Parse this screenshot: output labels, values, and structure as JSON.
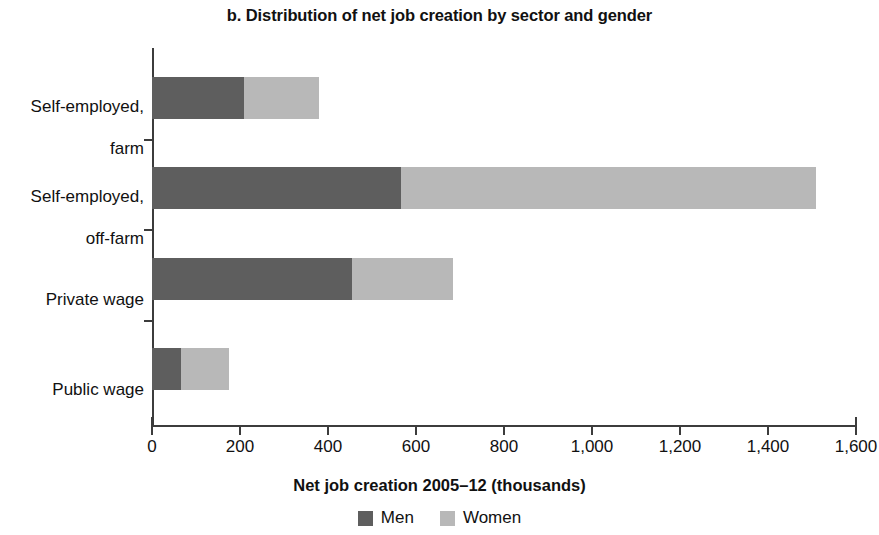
{
  "title": "b. Distribution of net job creation by sector and gender",
  "axis_title": "Net job creation 2005–12 (thousands)",
  "legend": {
    "items": [
      {
        "label": "Men",
        "color": "#5e5e5e"
      },
      {
        "label": "Women",
        "color": "#b8b8b8"
      }
    ]
  },
  "xticklabels": [
    "0",
    "200",
    "400",
    "600",
    "800",
    "1,000",
    "1,200",
    "1,400",
    "1,600"
  ],
  "categories": [
    {
      "line1": "Self-employed,",
      "line2": "farm"
    },
    {
      "line1": "Self-employed,",
      "line2": "off-farm"
    },
    {
      "line1": "Private wage",
      "line2": ""
    },
    {
      "line1": "Public wage",
      "line2": ""
    }
  ],
  "chart_data": {
    "type": "bar",
    "orientation": "horizontal",
    "stacked": true,
    "title": "b. Distribution of net job creation by sector and gender",
    "xlabel": "Net job creation 2005–12 (thousands)",
    "ylabel": "",
    "xlim": [
      0,
      1600
    ],
    "xticks": [
      0,
      200,
      400,
      600,
      800,
      1000,
      1200,
      1400,
      1600
    ],
    "xticklabels": [
      "0",
      "200",
      "400",
      "600",
      "800",
      "1,000",
      "1,200",
      "1,400",
      "1,600"
    ],
    "grid": false,
    "legend_position": "bottom-center",
    "categories": [
      "Self-employed, farm",
      "Self-employed, off-farm",
      "Private wage",
      "Public wage"
    ],
    "series": [
      {
        "name": "Men",
        "color": "#5e5e5e",
        "values": [
          210,
          565,
          455,
          65
        ]
      },
      {
        "name": "Women",
        "color": "#b8b8b8",
        "values": [
          170,
          945,
          230,
          110
        ]
      }
    ],
    "totals": [
      380,
      1510,
      685,
      175
    ]
  }
}
